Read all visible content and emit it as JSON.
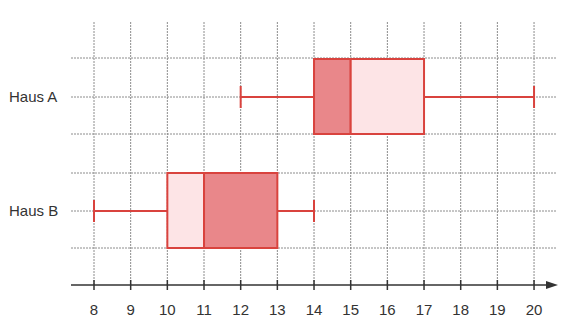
{
  "chart_data": {
    "type": "boxplot",
    "title": "",
    "xlabel": "",
    "ylabel": "",
    "xlim": [
      8,
      20
    ],
    "x_ticks": [
      8,
      9,
      10,
      11,
      12,
      13,
      14,
      15,
      16,
      17,
      18,
      19,
      20
    ],
    "grid": true,
    "legend": null,
    "categories": [
      "Haus A",
      "Haus B"
    ],
    "series": [
      {
        "name": "Haus A",
        "min": 12,
        "q1": 14,
        "median": 15,
        "q3": 17,
        "max": 20
      },
      {
        "name": "Haus B",
        "min": 8,
        "q1": 10,
        "median": 11,
        "q3": 13,
        "max": 14
      }
    ]
  },
  "labels": {
    "haus_a": "Haus A",
    "haus_b": "Haus B"
  },
  "axis": {
    "ticks": [
      "8",
      "9",
      "10",
      "11",
      "12",
      "13",
      "14",
      "15",
      "16",
      "17",
      "18",
      "19",
      "20"
    ]
  },
  "colors": {
    "stroke": "#d9433e",
    "fill_dark": "#e9878a",
    "fill_light": "#fde4e6",
    "grid": "#8c8c8c",
    "axis": "#333333"
  }
}
